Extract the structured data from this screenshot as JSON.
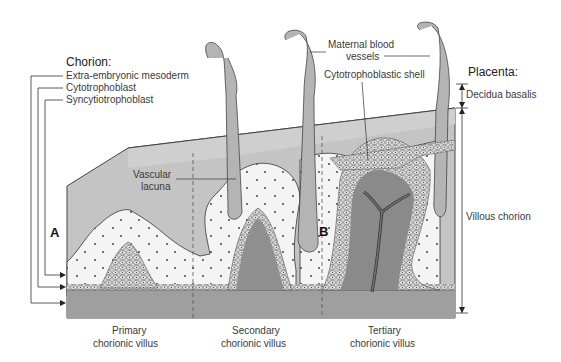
{
  "diagram": {
    "colors": {
      "background": "#ffffff",
      "decidua": "#c9c9c9",
      "mesoderm_base": "#a9a9a9",
      "lacuna": "#f3f3f3",
      "vessel": "#b8b8b8",
      "core": "#8c8c8c",
      "cells": "#d6d6d6",
      "line": "#444444"
    },
    "chorion": {
      "heading": "Chorion:",
      "layers": [
        {
          "label": "Extra-embryonic mesoderm"
        },
        {
          "label": "Cytotrophoblast"
        },
        {
          "label": "Syncytiotrophoblast"
        }
      ]
    },
    "placenta": {
      "heading": "Placenta:",
      "regions": [
        {
          "label": "Decidua basalis"
        },
        {
          "label": "Villous chorion"
        }
      ]
    },
    "callouts": {
      "maternal_vessels_line1": "Maternal blood",
      "maternal_vessels_line2": "vessels",
      "cytotrophoblastic_shell": "Cytotrophoblastic shell",
      "vascular_lacuna_line1": "Vascular",
      "vascular_lacuna_line2": "lacuna"
    },
    "markers": {
      "a": "A",
      "b": "B"
    },
    "stages": [
      {
        "line1": "Primary",
        "line2": "chorionic villus"
      },
      {
        "line1": "Secondary",
        "line2": "chorionic villus"
      },
      {
        "line1": "Tertiary",
        "line2": "chorionic villus"
      }
    ]
  }
}
